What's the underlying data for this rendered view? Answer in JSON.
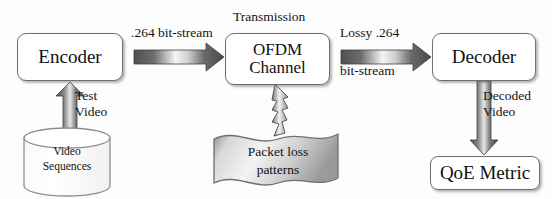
{
  "diagram": {
    "background_color": "#fdfdfd",
    "stroke_color": "#6f6f6f",
    "text_color": "#111111",
    "arrow_dark": "#4a4a4a",
    "arrow_light": "#f2f2f2"
  },
  "nodes": {
    "encoder": {
      "label": "Encoder",
      "shape": "rounded-rect"
    },
    "ofdm": {
      "line1": "OFDM",
      "line2": "Channel",
      "shape": "rounded-rect"
    },
    "decoder": {
      "label": "Decoder",
      "shape": "rounded-rect"
    },
    "qoe": {
      "label": "QoE Metric",
      "shape": "rounded-rect"
    },
    "video_sequences": {
      "line1": "Video",
      "line2": "Sequences",
      "shape": "cylinder-datastore"
    },
    "packet_loss": {
      "line1": "Packet loss",
      "line2": "patterns",
      "shape": "wavy-banner"
    }
  },
  "edges": {
    "encoder_to_ofdm": {
      "label": "​.264 bit-stream",
      "direction": "right"
    },
    "ofdm_top": {
      "label": "Transmission"
    },
    "ofdm_to_decoder": {
      "line1": "Lossy .264",
      "line2": "bit-stream",
      "direction": "right"
    },
    "seq_to_encoder": {
      "line1": "Test",
      "line2": "Video",
      "direction": "up"
    },
    "decoder_to_qoe": {
      "line1": "Decoded",
      "line2": "Video",
      "direction": "down"
    },
    "packet_loss_to_ofdm": {
      "label": "",
      "direction": "up",
      "style": "jagged-lightning"
    }
  }
}
